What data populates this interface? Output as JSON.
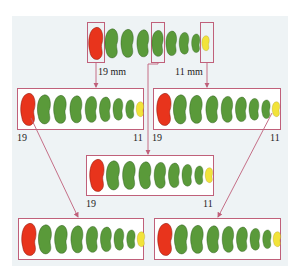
{
  "diagram": {
    "colors": {
      "outline": "#c0607a",
      "bean_large": "#e8341c",
      "bean_medium": "#5a9a3a",
      "bean_small": "#f2e33a",
      "panel_bg": "#eef3f5"
    },
    "top_row": {
      "label_large": "19 mm",
      "label_small": "11 mm"
    },
    "row2_left": {
      "label_left": "19",
      "label_right": "11"
    },
    "row2_right": {
      "label_left": "19",
      "label_right": "11"
    },
    "row3_middle": {
      "label_left": "19",
      "label_right": "11"
    },
    "bean_sequence": [
      "red",
      "green",
      "green",
      "green",
      "green",
      "green",
      "green",
      "green",
      "yellow"
    ]
  }
}
